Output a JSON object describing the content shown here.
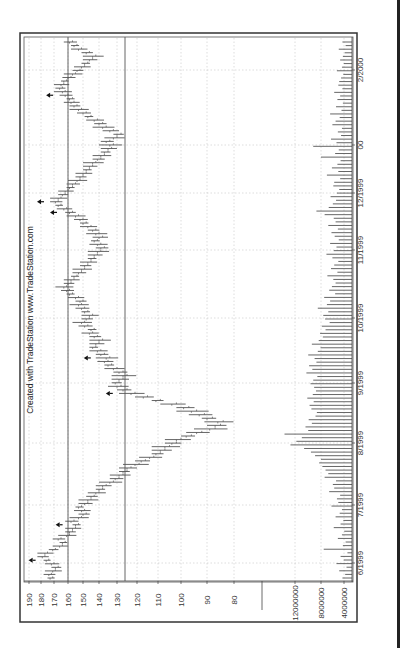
{
  "chart_data": {
    "type": "bar",
    "subtype": "ohlc-with-volume",
    "orientation": "rotated-90-ccw",
    "credit": "Created with TradeStation  www.TradeStation.com",
    "price_axis": {
      "ticks": [
        190,
        180,
        170,
        160,
        150,
        140,
        130,
        120,
        110,
        100,
        90,
        80
      ],
      "tick_screen_x": [
        29,
        41,
        54,
        68,
        83,
        99,
        117,
        137,
        158,
        181,
        207,
        234
      ],
      "range": [
        80,
        190
      ]
    },
    "volume_axis": {
      "ticks": [
        "12000000",
        "8000000",
        "4000000"
      ],
      "tick_screen_x": [
        295,
        321,
        344
      ]
    },
    "date_axis": {
      "labels": [
        "6/1999",
        "7/1999",
        "8/1999",
        "9/1999",
        "10/1999",
        "11/1999",
        "12/1999",
        "00",
        "2/2000"
      ],
      "label_screen_y": [
        563,
        505,
        443,
        383,
        318,
        250,
        193,
        145,
        70
      ]
    },
    "reference_lines": [
      160,
      126
    ],
    "grid": true,
    "price_series_approx": [
      172,
      173,
      170,
      168,
      171,
      175,
      178,
      176,
      170,
      165,
      163,
      166,
      160,
      158,
      156,
      154,
      157,
      152,
      149,
      150,
      152,
      148,
      146,
      144,
      141,
      139,
      137,
      133,
      130,
      128,
      126,
      124,
      120,
      117,
      113,
      110,
      108,
      106,
      103,
      101,
      97,
      93,
      88,
      86,
      85,
      89,
      92,
      95,
      98,
      103,
      110,
      116,
      122,
      126,
      129,
      130,
      128,
      126,
      128,
      131,
      134,
      136,
      135,
      138,
      140,
      143,
      141,
      139,
      142,
      145,
      144,
      148,
      150,
      147,
      145,
      148,
      150,
      152,
      151,
      154,
      158,
      160,
      162,
      159,
      157,
      155,
      152,
      150,
      148,
      146,
      144,
      142,
      140,
      138,
      140,
      142,
      139,
      141,
      143,
      146,
      149,
      151,
      154,
      158,
      162,
      166,
      168,
      166,
      163,
      161,
      158,
      156,
      153,
      151,
      149,
      147,
      145,
      143,
      140,
      138,
      136,
      134,
      133,
      135,
      131,
      129,
      133,
      137,
      139,
      142,
      146,
      149,
      152,
      155,
      157,
      158,
      161,
      163,
      165,
      164,
      162,
      159,
      156,
      153,
      150,
      148,
      145,
      143,
      147,
      152,
      155,
      158
    ],
    "volume_series_approx_millions": [
      2.1,
      1.5,
      2.8,
      1.2,
      3.4,
      1.8,
      2.5,
      1.0,
      6.2,
      2.0,
      1.4,
      3.1,
      2.2,
      1.7,
      4.0,
      2.5,
      1.9,
      3.6,
      2.7,
      2.2,
      4.5,
      3.0,
      3.3,
      2.6,
      5.0,
      3.9,
      4.2,
      3.5,
      6.0,
      5.2,
      5.8,
      6.5,
      7.2,
      6.8,
      8.1,
      9.0,
      10.5,
      13.5,
      12.2,
      11.0,
      14.8,
      9.6,
      10.2,
      8.8,
      9.5,
      8.0,
      7.7,
      8.9,
      9.3,
      8.4,
      9.8,
      8.6,
      7.9,
      8.3,
      9.1,
      8.5,
      7.6,
      10.0,
      8.7,
      9.4,
      7.8,
      8.2,
      9.6,
      7.5,
      6.9,
      8.8,
      7.3,
      6.4,
      7.0,
      5.8,
      6.6,
      4.9,
      5.9,
      6.3,
      5.2,
      7.5,
      5.5,
      4.8,
      6.1,
      3.7,
      5.0,
      4.4,
      3.6,
      4.1,
      5.4,
      3.2,
      4.6,
      3.9,
      3.0,
      4.3,
      5.6,
      4.0,
      3.4,
      4.8,
      2.9,
      3.8,
      4.5,
      3.1,
      5.2,
      3.6,
      4.0,
      6.0,
      7.8,
      5.1,
      4.2,
      3.5,
      4.7,
      3.3,
      2.8,
      4.1,
      3.9,
      2.6,
      5.5,
      3.0,
      4.4,
      3.2,
      2.5,
      6.8,
      3.7,
      2.9,
      8.5,
      3.4,
      4.6,
      2.4,
      3.1,
      2.2,
      4.3,
      3.6,
      2.7,
      4.8,
      2.3,
      3.5,
      2.0,
      3.2,
      2.6,
      3.9,
      2.1,
      3.0,
      2.8,
      2.4,
      1.9,
      3.3,
      2.2,
      1.8,
      2.6,
      2.0,
      1.6,
      2.9,
      1.4,
      2.1
    ],
    "arrow_markers_index": [
      5,
      15,
      52,
      62,
      103,
      106,
      136
    ],
    "xlabel": "",
    "ylabel": "",
    "title": ""
  },
  "colors": {
    "frame": "#333333",
    "bar": "#555555",
    "grid": "#bbbbbb",
    "refline": "#555555"
  }
}
